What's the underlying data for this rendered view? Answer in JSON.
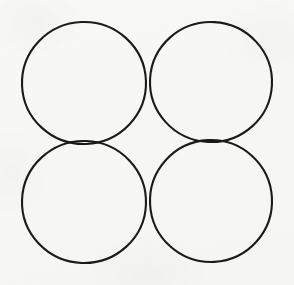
{
  "figure": {
    "background_color": "#f8f8f7",
    "stroke_color": "#1a1a1a",
    "stroke_width": 2,
    "canvas": {
      "width": 294,
      "height": 285
    },
    "shape_count": 4,
    "arrangement": "2x2 grid, mutually tangent",
    "shapes": [
      {
        "name": "top-left-circle",
        "position": "top-left",
        "cx": 84,
        "cy": 83,
        "rx": 62,
        "ry": 61,
        "rotation": -2,
        "fill": "none"
      },
      {
        "name": "top-right-circle",
        "position": "top-right",
        "cx": 211,
        "cy": 82,
        "rx": 61,
        "ry": 60,
        "rotation": 3,
        "fill": "none"
      },
      {
        "name": "bottom-left-circle",
        "position": "bottom-left",
        "cx": 84,
        "cy": 202,
        "rx": 62,
        "ry": 61,
        "rotation": 2,
        "fill": "none"
      },
      {
        "name": "bottom-right-circle",
        "position": "bottom-right",
        "cx": 211,
        "cy": 201,
        "rx": 61,
        "ry": 61,
        "rotation": -3,
        "fill": "none"
      }
    ],
    "tangent_points": [
      {
        "name": "top-pair-tangent",
        "x": 147,
        "y": 82
      },
      {
        "name": "bottom-pair-tangent",
        "x": 147,
        "y": 201
      },
      {
        "name": "left-pair-tangent",
        "x": 84,
        "y": 142
      },
      {
        "name": "right-pair-tangent",
        "x": 211,
        "y": 141
      }
    ]
  }
}
